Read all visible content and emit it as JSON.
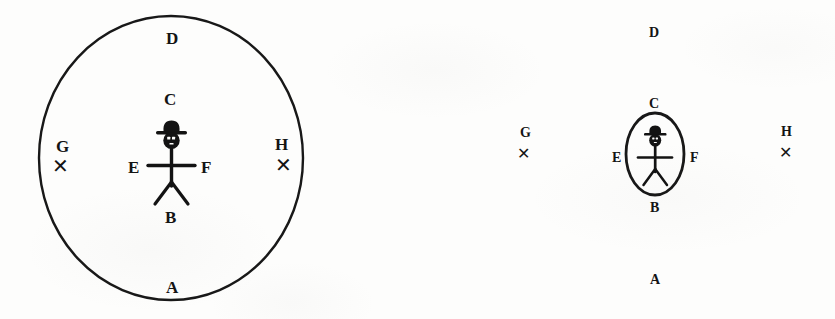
{
  "figure": {
    "background_color": "#fdfdfc",
    "ink_color": "#131313",
    "panels": [
      {
        "id": "left-panel",
        "name": "large-circle-diagram",
        "boundary": {
          "shape": "circle",
          "name": "large-circle",
          "cx": 171,
          "cy": 158,
          "r": 132,
          "stroke_width": 2.4,
          "present": true
        },
        "figure_label": "stick-figure-with-hat",
        "labels": [
          {
            "key": "D",
            "text": "D",
            "role": "top-outer",
            "x": 172,
            "y": 38,
            "size": "lg"
          },
          {
            "key": "C",
            "text": "C",
            "role": "top-inner",
            "x": 170,
            "y": 99,
            "size": "lg"
          },
          {
            "key": "G",
            "text": "G",
            "role": "left-outer",
            "x": 63,
            "y": 146,
            "size": "lg"
          },
          {
            "key": "H",
            "text": "H",
            "role": "right-outer",
            "x": 282,
            "y": 144,
            "size": "lg"
          },
          {
            "key": "E",
            "text": "E",
            "role": "left-inner",
            "x": 134,
            "y": 167,
            "size": "lg"
          },
          {
            "key": "F",
            "text": "F",
            "role": "right-inner",
            "x": 206,
            "y": 167,
            "size": "lg"
          },
          {
            "key": "B",
            "text": "B",
            "role": "bottom-inner",
            "x": 171,
            "y": 217,
            "size": "lg"
          },
          {
            "key": "A",
            "text": "A",
            "role": "bottom-outer",
            "x": 172,
            "y": 287,
            "size": "lg"
          }
        ],
        "x_marks": [
          {
            "key": "G-mark",
            "role": "left-target",
            "x": 60,
            "y": 166,
            "size": "lg"
          },
          {
            "key": "H-mark",
            "role": "right-target",
            "x": 283,
            "y": 165,
            "size": "lg"
          }
        ]
      },
      {
        "id": "right-panel",
        "name": "small-ellipse-diagram",
        "boundary": {
          "shape": "ellipse",
          "name": "small-ellipse",
          "cx": 235,
          "cy": 154,
          "rx": 29,
          "ry": 41,
          "stroke_width": 2.6,
          "present": true
        },
        "figure_label": "stick-figure-with-hat",
        "labels": [
          {
            "key": "D",
            "text": "D",
            "role": "top-outer",
            "x": 234,
            "y": 33,
            "size": "sm"
          },
          {
            "key": "C",
            "text": "C",
            "role": "top-inner",
            "x": 234,
            "y": 104,
            "size": "sm"
          },
          {
            "key": "G",
            "text": "G",
            "role": "left-outer",
            "x": 105,
            "y": 133,
            "size": "sm"
          },
          {
            "key": "H",
            "text": "H",
            "role": "right-outer",
            "x": 366,
            "y": 132,
            "size": "sm"
          },
          {
            "key": "E",
            "text": "E",
            "role": "left-inner",
            "x": 196,
            "y": 158,
            "size": "sm"
          },
          {
            "key": "F",
            "text": "F",
            "role": "right-inner",
            "x": 273,
            "y": 158,
            "size": "sm"
          },
          {
            "key": "B",
            "text": "B",
            "role": "bottom-inner",
            "x": 234,
            "y": 208,
            "size": "sm"
          },
          {
            "key": "A",
            "text": "A",
            "role": "bottom-outer",
            "x": 235,
            "y": 280,
            "size": "sm"
          }
        ],
        "x_marks": [
          {
            "key": "G-mark",
            "role": "left-target",
            "x": 103,
            "y": 155,
            "size": "sm"
          },
          {
            "key": "H-mark",
            "role": "right-target",
            "x": 365,
            "y": 153,
            "size": "sm"
          }
        ]
      }
    ],
    "legend_keys": [
      "A",
      "B",
      "C",
      "D",
      "E",
      "F",
      "G",
      "H"
    ]
  }
}
